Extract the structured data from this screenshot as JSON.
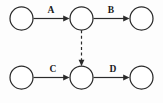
{
  "diagram": {
    "type": "node-link-diagram",
    "canvas": {
      "width": 163,
      "height": 103,
      "background": "#fdfdfd"
    },
    "style": {
      "stroke_color": "#2b2b2b",
      "node_fill": "#ffffff",
      "label_color": "#1a1a1a",
      "node_radius": 11.5,
      "stroke_width": 1.2
    },
    "nodes": [
      {
        "id": "n1",
        "name": "top-left-node",
        "cx": 21.5,
        "cy": 18.5,
        "r": 11.5,
        "label": ""
      },
      {
        "id": "n2",
        "name": "top-middle-node",
        "cx": 81.5,
        "cy": 18.5,
        "r": 11.5,
        "label": ""
      },
      {
        "id": "n3",
        "name": "top-right-node",
        "cx": 141.5,
        "cy": 18.5,
        "r": 11.5,
        "label": ""
      },
      {
        "id": "n4",
        "name": "bottom-left-node",
        "cx": 21.5,
        "cy": 77.5,
        "r": 11.5,
        "label": ""
      },
      {
        "id": "n5",
        "name": "bottom-middle-node",
        "cx": 81.5,
        "cy": 77.5,
        "r": 11.5,
        "label": ""
      },
      {
        "id": "n6",
        "name": "bottom-right-node",
        "cx": 141.5,
        "cy": 77.5,
        "r": 11.5,
        "label": ""
      }
    ],
    "edges": [
      {
        "id": "e1",
        "name": "edge-a",
        "label": "A",
        "from": "n1",
        "to": "n2",
        "style": "solid",
        "direction": "horizontal-right",
        "x1": 33.5,
        "y1": 18.5,
        "x2": 69.5,
        "y2": 18.5,
        "label_x": 51,
        "label_y": 13
      },
      {
        "id": "e2",
        "name": "edge-b",
        "label": "B",
        "from": "n2",
        "to": "n3",
        "style": "solid",
        "direction": "horizontal-right",
        "x1": 93.5,
        "y1": 18.5,
        "x2": 129.5,
        "y2": 18.5,
        "label_x": 111,
        "label_y": 13
      },
      {
        "id": "e3",
        "name": "edge-c",
        "label": "C",
        "from": "n4",
        "to": "n5",
        "style": "solid",
        "direction": "horizontal-right",
        "x1": 33.5,
        "y1": 77.5,
        "x2": 69.5,
        "y2": 77.5,
        "label_x": 53,
        "label_y": 72
      },
      {
        "id": "e4",
        "name": "edge-d",
        "label": "D",
        "from": "n5",
        "to": "n6",
        "style": "solid",
        "direction": "horizontal-right",
        "x1": 93.5,
        "y1": 77.5,
        "x2": 129.5,
        "y2": 77.5,
        "label_x": 113,
        "label_y": 72
      },
      {
        "id": "e5",
        "name": "edge-dashed-vertical",
        "label": "",
        "from": "n2",
        "to": "n5",
        "style": "dashed",
        "direction": "vertical-down",
        "x1": 81.5,
        "y1": 30.0,
        "x2": 81.5,
        "y2": 66.0,
        "label_x": 0,
        "label_y": 0
      }
    ]
  }
}
